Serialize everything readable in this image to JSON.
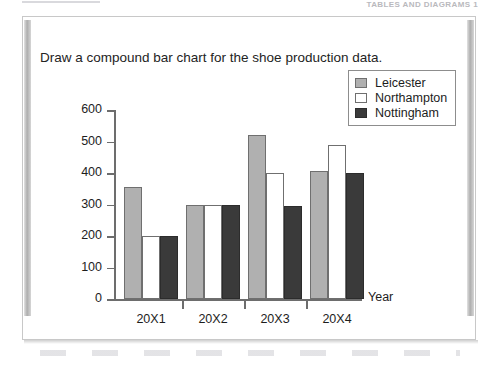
{
  "page": {
    "running_header": "TABLES AND DIAGRAMS 1"
  },
  "prompt": "Draw a compound bar chart for the shoe production data.",
  "legend": {
    "items": [
      {
        "label": "Leicester",
        "swatch": "light-gray"
      },
      {
        "label": "Northampton",
        "swatch": "white"
      },
      {
        "label": "Nottingham",
        "swatch": "dark-gray"
      }
    ]
  },
  "axis": {
    "x_title": "Year",
    "y_ticks": [
      "600",
      "500",
      "400",
      "300",
      "200",
      "100",
      "0"
    ],
    "x_categories": [
      "20X1",
      "20X2",
      "20X3",
      "20X4"
    ]
  },
  "colors": {
    "leicester": "#b0b0b0",
    "northampton": "#ffffff",
    "nottingham": "#3a3a3a",
    "axis": "#6d6d6d",
    "page_border": "#c8c8c8"
  },
  "chart_data": {
    "type": "bar",
    "title": "",
    "xlabel": "Year",
    "ylabel": "",
    "ylim": [
      0,
      600
    ],
    "ytick_step": 100,
    "grid": false,
    "legend_position": "top-right",
    "categories": [
      "20X1",
      "20X2",
      "20X3",
      "20X4"
    ],
    "series": [
      {
        "name": "Leicester",
        "color": "#b0b0b0",
        "values": [
          355,
          300,
          520,
          405
        ]
      },
      {
        "name": "Northampton",
        "color": "#ffffff",
        "values": [
          200,
          300,
          400,
          490
        ]
      },
      {
        "name": "Nottingham",
        "color": "#3a3a3a",
        "values": [
          200,
          300,
          295,
          400
        ]
      }
    ]
  }
}
